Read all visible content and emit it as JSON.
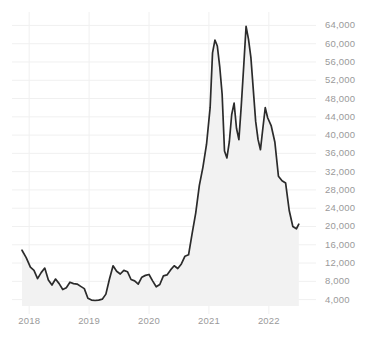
{
  "chart_data": {
    "type": "line",
    "title": "",
    "subtitle": "",
    "xlabel": "",
    "ylabel": "",
    "grid": true,
    "legend": false,
    "legend_position": "none",
    "area_fill": true,
    "line_color": "#2b2b2b",
    "fill_color": "#f2f2f2",
    "grid_color": "#f0f0f0",
    "tick_label_color": "#9a9a9a",
    "background_color": "#ffffff",
    "xlim": [
      2017.78,
      2022.62
    ],
    "ylim": [
      2600,
      66500
    ],
    "xticks": [
      2018,
      2019,
      2020,
      2021,
      2022
    ],
    "xtick_labels": [
      "2018",
      "2019",
      "2020",
      "2021",
      "2022"
    ],
    "yticks": [
      4000,
      8000,
      12000,
      16000,
      20000,
      24000,
      28000,
      32000,
      36000,
      40000,
      44000,
      48000,
      52000,
      56000,
      60000,
      64000
    ],
    "ytick_labels": [
      "4,000",
      "8,000",
      "12,000",
      "16,000",
      "20,000",
      "24,000",
      "28,000",
      "32,000",
      "36,000",
      "40,000",
      "44,000",
      "48,000",
      "52,000",
      "56,000",
      "60,000",
      "64,000"
    ],
    "series": [
      {
        "name": "price",
        "x": [
          2017.88,
          2017.95,
          2018.02,
          2018.08,
          2018.14,
          2018.2,
          2018.26,
          2018.32,
          2018.38,
          2018.44,
          2018.5,
          2018.56,
          2018.62,
          2018.68,
          2018.74,
          2018.8,
          2018.86,
          2018.92,
          2018.98,
          2019.04,
          2019.1,
          2019.16,
          2019.22,
          2019.28,
          2019.34,
          2019.4,
          2019.46,
          2019.52,
          2019.58,
          2019.64,
          2019.7,
          2019.76,
          2019.82,
          2019.88,
          2019.94,
          2020.0,
          2020.06,
          2020.12,
          2020.18,
          2020.24,
          2020.3,
          2020.36,
          2020.42,
          2020.48,
          2020.54,
          2020.6,
          2020.66,
          2020.72,
          2020.78,
          2020.84,
          2020.9,
          2020.96,
          2021.02,
          2021.06,
          2021.1,
          2021.14,
          2021.18,
          2021.22,
          2021.26,
          2021.3,
          2021.34,
          2021.38,
          2021.42,
          2021.46,
          2021.5,
          2021.54,
          2021.58,
          2021.62,
          2021.66,
          2021.7,
          2021.74,
          2021.78,
          2021.82,
          2021.86,
          2021.9,
          2021.94,
          2021.98,
          2022.04,
          2022.1,
          2022.16,
          2022.22,
          2022.28,
          2022.34,
          2022.4,
          2022.46,
          2022.5
        ],
        "values": [
          14800,
          13200,
          11100,
          10400,
          8600,
          9900,
          10900,
          8300,
          7200,
          8500,
          7500,
          6200,
          6600,
          7800,
          7500,
          7400,
          6900,
          6400,
          4300,
          3900,
          3800,
          3900,
          4100,
          5200,
          8500,
          11400,
          10200,
          9600,
          10400,
          10100,
          8400,
          8100,
          7400,
          8900,
          9300,
          9500,
          8100,
          6800,
          7300,
          9200,
          9400,
          10500,
          11400,
          10800,
          11800,
          13500,
          13800,
          18500,
          23000,
          29000,
          33000,
          38000,
          46000,
          58000,
          60800,
          59500,
          55000,
          49000,
          36500,
          35000,
          38500,
          44500,
          47000,
          41500,
          39000,
          46500,
          55000,
          63800,
          61000,
          57000,
          50000,
          43000,
          39000,
          36800,
          41500,
          46000,
          43800,
          42000,
          38500,
          31000,
          30000,
          29500,
          23500,
          20000,
          19500,
          20500
        ]
      }
    ],
    "annotations": []
  }
}
